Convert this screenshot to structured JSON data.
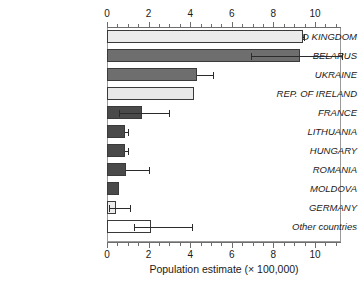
{
  "chart_data": {
    "type": "bar",
    "orientation": "horizontal",
    "title": "",
    "xlabel": "Population estimate (× 100,000)",
    "ylabel": "",
    "xlim": [
      0,
      11.25
    ],
    "xticks": [
      0,
      2,
      4,
      6,
      8,
      10
    ],
    "xtick_labels": [
      "0",
      "2",
      "4",
      "6",
      "8",
      "10"
    ],
    "xminor_step": 0.5,
    "grid": false,
    "legend": "none",
    "axis_top": true,
    "axis_bottom": true,
    "categories": [
      "UNITED KINGDOM",
      "BELARUS",
      "UKRAINE",
      "REP. OF IRELAND",
      "FRANCE",
      "LITHUANIA",
      "HUNGARY",
      "ROMANIA",
      "MOLDOVA",
      "GERMANY",
      "Other countries"
    ],
    "values": [
      9.4,
      9.3,
      4.35,
      4.2,
      1.7,
      0.85,
      0.85,
      0.9,
      0.6,
      0.45,
      2.1
    ],
    "error_high": [
      9.45,
      11.3,
      5.1,
      null,
      3.0,
      1.0,
      1.0,
      2.0,
      null,
      1.1,
      4.1
    ],
    "error_low": [
      null,
      6.9,
      null,
      null,
      0.6,
      null,
      null,
      null,
      null,
      0.1,
      1.3
    ],
    "bar_fills": [
      "#ebebeb",
      "#6e6e6e",
      "#6e6e6e",
      "#e8e8e8",
      "#4a4a4a",
      "#4a4a4a",
      "#4a4a4a",
      "#4a4a4a",
      "#4a4a4a",
      "#ededed",
      "#ffffff"
    ],
    "bar_edge_color": "#3a3a3a",
    "error_color": "#2b2b2b",
    "axis_color": "#6d6d6d",
    "background": "#ffffff"
  }
}
